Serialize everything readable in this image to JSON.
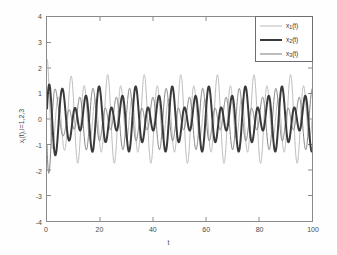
{
  "figure": {
    "background_color": "#fefefe",
    "axes_background_color": "#ffffff",
    "axes_border_color": "#8a8a8a"
  },
  "axis": {
    "xlabel": "t",
    "ylabel_text": "x",
    "ylabel_sub": "i",
    "ylabel_tail": "(t),i=1,2,3",
    "xticks": [
      "0",
      "20",
      "40",
      "60",
      "80",
      "100"
    ],
    "yticks": [
      "4",
      "3",
      "2",
      "1",
      "0",
      "-1",
      "-2",
      "-3",
      "-4"
    ]
  },
  "legend": {
    "entries": [
      {
        "label_main": "x",
        "label_sub": "1",
        "label_tail": "(t)",
        "color": "#b9b9b9",
        "width": 1
      },
      {
        "label_main": "x",
        "label_sub": "2",
        "label_tail": "(t)",
        "color": "#3a3a3a",
        "width": 2
      },
      {
        "label_main": "x",
        "label_sub": "3",
        "label_tail": "(t)",
        "color": "#7d7d7d",
        "width": 1
      }
    ]
  },
  "chart_data": {
    "type": "line",
    "title": "",
    "xlabel": "t",
    "ylabel": "x_i(t),i=1,2,3",
    "xlim": [
      0,
      100
    ],
    "ylim": [
      -4,
      4
    ],
    "xticks": [
      0,
      20,
      40,
      60,
      80,
      100
    ],
    "yticks": [
      -4,
      -3,
      -2,
      -1,
      0,
      1,
      2,
      3,
      4
    ],
    "grid": false,
    "legend_position": "upper-right",
    "series": [
      {
        "name": "x_1(t)",
        "color": "#b9b9b9",
        "linewidth": 1,
        "initial_value": 2.3,
        "steady_amplitude": 1.75,
        "mean": 0.0,
        "dominant_periods": [
          4.6,
          6.9
        ],
        "beat_period": 9.2,
        "model": {
          "type": "sum_of_sines_with_transient",
          "components": [
            {
              "amplitude": 1.25,
              "period": 4.6,
              "phase": 1.5708
            },
            {
              "amplitude": 0.55,
              "period": 6.9,
              "phase": 0.0
            }
          ],
          "transient": {
            "amplitude": 1.1,
            "decay_time": 3.0,
            "period": 3.6,
            "phase": 1.5708
          }
        }
      },
      {
        "name": "x_2(t)",
        "color": "#3a3a3a",
        "linewidth": 2,
        "initial_value": 0.15,
        "steady_amplitude": 1.3,
        "mean": 0.0,
        "dominant_periods": [
          4.6,
          6.9
        ],
        "beat_period": 9.2,
        "model": {
          "type": "sum_of_sines_with_transient",
          "components": [
            {
              "amplitude": 0.85,
              "period": 4.6,
              "phase": 0.0
            },
            {
              "amplitude": 0.48,
              "period": 6.9,
              "phase": 2.0944
            }
          ],
          "transient": {
            "amplitude": 0.55,
            "decay_time": 4.0,
            "period": 3.6,
            "phase": 0.0
          }
        }
      },
      {
        "name": "x_3(t)",
        "color": "#7d7d7d",
        "linewidth": 1,
        "initial_value": -2.1,
        "steady_amplitude": 1.2,
        "mean": 0.0,
        "dominant_periods": [
          4.6,
          6.9
        ],
        "beat_period": 9.2,
        "model": {
          "type": "sum_of_sines_with_transient",
          "components": [
            {
              "amplitude": 0.8,
              "period": 4.6,
              "phase": 3.1416
            },
            {
              "amplitude": 0.45,
              "period": 6.9,
              "phase": 4.1888
            }
          ],
          "transient": {
            "amplitude": 1.3,
            "decay_time": 3.2,
            "period": 3.6,
            "phase": 3.6652
          }
        }
      }
    ]
  }
}
